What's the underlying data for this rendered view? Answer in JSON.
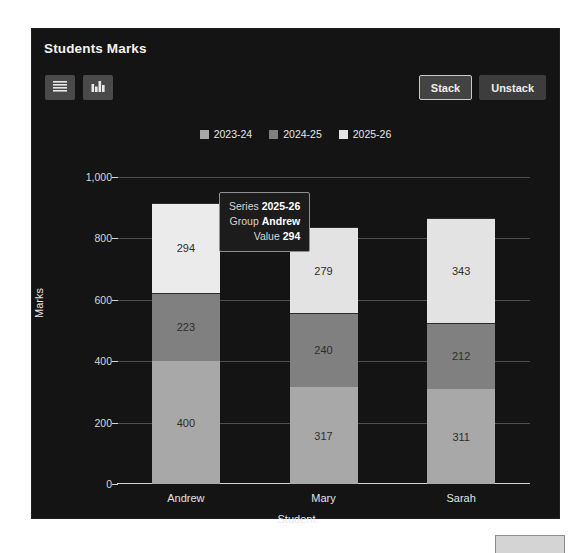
{
  "card": {
    "title": "Students Marks",
    "background": "#141414"
  },
  "toolbar": {
    "left_buttons": [
      {
        "name": "menu-icon",
        "label": "Menu"
      },
      {
        "name": "bar-chart-icon",
        "label": "Chart"
      }
    ],
    "right_buttons": [
      {
        "label": "Stack",
        "active": true
      },
      {
        "label": "Unstack",
        "active": false
      }
    ]
  },
  "tooltip": {
    "series_key": "Series",
    "series_value": "2025-26",
    "group_key": "Group",
    "group_value": "Andrew",
    "value_key": "Value",
    "value_value": "294"
  },
  "corner_box": {
    "color": "#d4d4d4"
  },
  "chart_data": {
    "type": "bar",
    "stacked": true,
    "title": "Students Marks",
    "xlabel": "Student",
    "ylabel": "Marks",
    "categories": [
      "Andrew",
      "Mary",
      "Sarah"
    ],
    "ylim": [
      0,
      1000
    ],
    "yticks": [
      0,
      200,
      400,
      600,
      800,
      1000
    ],
    "ytick_labels": [
      "0",
      "200",
      "400",
      "600",
      "800",
      "1,000"
    ],
    "grid": true,
    "legend_position": "top-center",
    "colors": {
      "2023-24": "#a8a8a8",
      "2024-25": "#808080",
      "2025-26": "#e3e3e3",
      "2025-26-highlight": "#ebebeb"
    },
    "series": [
      {
        "name": "2023-24",
        "color": "#a8a8a8",
        "values": [
          400,
          317,
          311
        ]
      },
      {
        "name": "2024-25",
        "color": "#808080",
        "values": [
          223,
          240,
          212
        ]
      },
      {
        "name": "2025-26",
        "color": "#e3e3e3",
        "values": [
          294,
          279,
          343
        ]
      }
    ],
    "totals": [
      917,
      836,
      866
    ]
  }
}
